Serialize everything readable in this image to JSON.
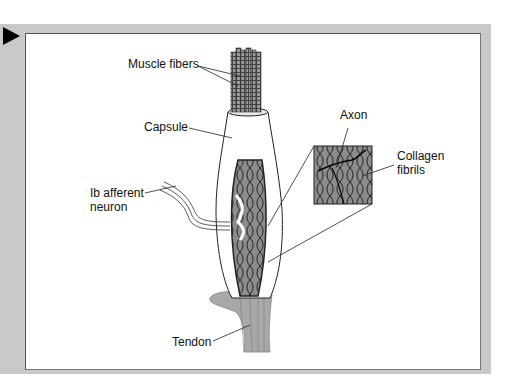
{
  "diagram": {
    "type": "anatomical illustration",
    "labels": {
      "muscle_fibers": "Muscle fibers",
      "capsule": "Capsule",
      "axon": "Axon",
      "collagen_line1": "Collagen",
      "collagen_line2": "fibrils",
      "afferent_line1": "Ib afferent",
      "afferent_line2": "neuron",
      "tendon": "Tendon"
    },
    "colors": {
      "frame": "#c9c9c9",
      "panel": "#ffffff",
      "fiber_fill": "#8a8a8a",
      "capsule_interior": "#8c8c8c",
      "tendon": "#a8a8a8",
      "line": "#1a1a1a"
    }
  }
}
